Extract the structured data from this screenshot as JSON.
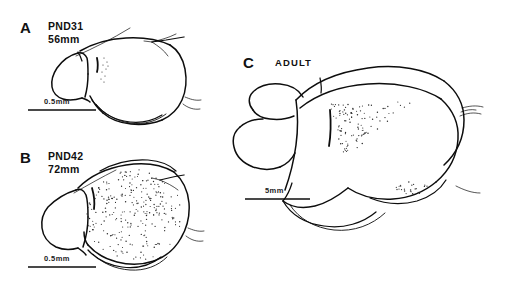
{
  "figure": {
    "type": "scientific-line-drawing",
    "background_color": "#ffffff",
    "ink_color": "#0d0d0d"
  },
  "panels": [
    {
      "id": "A",
      "letter": "A",
      "caption_line1": "PND31",
      "caption_line2": "56mm",
      "scale_label": "0.5mm",
      "stipple_density": "very-sparse"
    },
    {
      "id": "B",
      "letter": "B",
      "caption_line1": "PND42",
      "caption_line2": "72mm",
      "scale_label": "0.5mm",
      "stipple_density": "dense"
    },
    {
      "id": "C",
      "letter": "C",
      "caption_line1": "ADULT",
      "caption_line2": "",
      "scale_label": "5mm",
      "stipple_density": "moderate"
    }
  ],
  "chart_data": {
    "type": "scatter",
    "title": "",
    "xlabel": "",
    "ylabel": "",
    "legend_position": "none",
    "grid": false,
    "series": [
      {
        "name": "A-stipple",
        "panel": "A",
        "count": 9,
        "points": [
          [
            96,
            62
          ],
          [
            99,
            60
          ],
          [
            101,
            65
          ],
          [
            97,
            68
          ],
          [
            100,
            71
          ],
          [
            103,
            67
          ],
          [
            99,
            75
          ],
          [
            102,
            78
          ],
          [
            97,
            80
          ]
        ]
      },
      {
        "name": "B-stipple",
        "panel": "B",
        "count": 236,
        "region": "large oval over cerebrum, densest upper-left"
      },
      {
        "name": "C-stipple-upper",
        "panel": "C",
        "count": 96,
        "region": "triangular wedge below dorsal line"
      },
      {
        "name": "C-stipple-lower",
        "panel": "C",
        "count": 22,
        "region": "small ellipse above ventral curve"
      }
    ]
  },
  "scale_bars": {
    "a": {
      "label": "0.5mm",
      "x1": 28,
      "x2": 96,
      "y": 107
    },
    "b": {
      "label": "0.5mm",
      "x1": 28,
      "x2": 96,
      "y": 264
    },
    "c": {
      "label": "5mm",
      "x1": 245,
      "x2": 310,
      "y": 196
    }
  }
}
